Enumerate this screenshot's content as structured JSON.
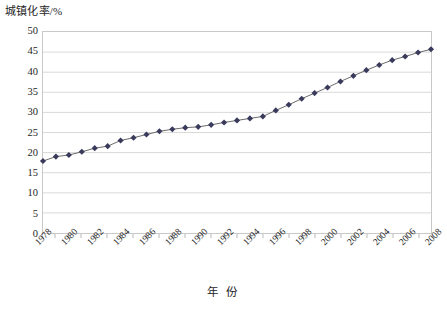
{
  "chart_data": {
    "type": "line",
    "title": "",
    "ylabel": "城镇化率/%",
    "xlabel": "年 份",
    "ylim": [
      0,
      50
    ],
    "y_ticks": [
      0,
      5,
      10,
      15,
      20,
      25,
      30,
      35,
      40,
      45,
      50
    ],
    "grid": true,
    "legend": "none",
    "marker": "diamond",
    "series_color": "#3a3a5c",
    "line_color": "#6a6a6a",
    "grid_color": "#d9d9d9",
    "border_color": "#c9c9c9",
    "x": [
      "1978",
      "1979",
      "1980",
      "1981",
      "1982",
      "1983",
      "1984",
      "1985",
      "1986",
      "1987",
      "1988",
      "1989",
      "1990",
      "1991",
      "1992",
      "1993",
      "1994",
      "1995",
      "1996",
      "1997",
      "1998",
      "1999",
      "2000",
      "2001",
      "2002",
      "2003",
      "2004",
      "2005",
      "2006",
      "2007",
      "2008"
    ],
    "x_tick_labels": [
      "1978",
      "1980",
      "1982",
      "1984",
      "1986",
      "1988",
      "1990",
      "1992",
      "1994",
      "1996",
      "1998",
      "2000",
      "2002",
      "2004",
      "2006",
      "2008"
    ],
    "values": [
      17.9,
      19.0,
      19.4,
      20.2,
      21.1,
      21.6,
      23.0,
      23.7,
      24.5,
      25.3,
      25.8,
      26.2,
      26.4,
      26.9,
      27.5,
      28.0,
      28.5,
      29.0,
      30.5,
      31.9,
      33.4,
      34.8,
      36.2,
      37.7,
      39.1,
      40.5,
      41.8,
      43.0,
      43.9,
      44.9,
      45.7
    ]
  }
}
